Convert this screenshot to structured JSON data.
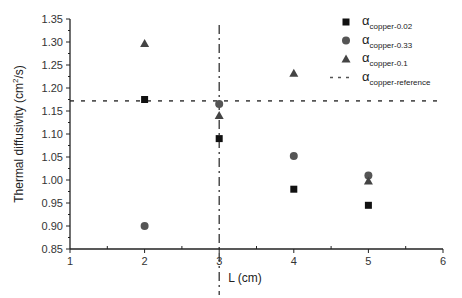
{
  "chart_data": {
    "type": "scatter",
    "title": "",
    "xlabel": "L (cm)",
    "ylabel": "Thermal diffusivity (cm²/s)",
    "ylabel_parts": {
      "main": "Thermal diffusivity (cm",
      "sup": "2",
      "tail": "/s)"
    },
    "xlim": [
      1,
      6
    ],
    "ylim": [
      0.85,
      1.35
    ],
    "xticks": [
      1,
      2,
      3,
      4,
      5,
      6
    ],
    "yticks": [
      0.85,
      0.9,
      0.95,
      1.0,
      1.05,
      1.1,
      1.15,
      1.2,
      1.25,
      1.3,
      1.35
    ],
    "grid": false,
    "legend_position": "upper right",
    "series": [
      {
        "name": "α copper-0.02",
        "symbol": "α",
        "subscript": "copper-0.02",
        "marker": "square",
        "color": "#111111",
        "x": [
          2,
          3,
          4,
          5
        ],
        "y": [
          1.175,
          1.09,
          0.98,
          0.945
        ]
      },
      {
        "name": "α copper-0.33",
        "symbol": "α",
        "subscript": "copper-0.33",
        "marker": "circle",
        "color": "#555555",
        "x": [
          2,
          3,
          4,
          5
        ],
        "y": [
          0.9,
          1.165,
          1.052,
          1.01
        ]
      },
      {
        "name": "α copper-0.1",
        "symbol": "α",
        "subscript": "copper-0.1",
        "marker": "triangle",
        "color": "#444444",
        "x": [
          2,
          3,
          4,
          5
        ],
        "y": [
          1.297,
          1.14,
          1.232,
          0.998
        ]
      }
    ],
    "reference_lines": [
      {
        "name": "α copper-reference",
        "symbol": "α",
        "subscript": "copper-reference",
        "orientation": "horizontal",
        "style": "dashed",
        "value": 1.172,
        "color": "#555555"
      },
      {
        "name": "",
        "orientation": "vertical",
        "style": "dash-dot",
        "value": 3,
        "color": "#333333"
      }
    ]
  }
}
